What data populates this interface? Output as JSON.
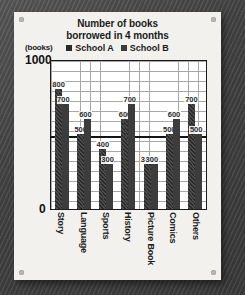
{
  "card": {
    "corner_dot": "screw-dot"
  },
  "chart_data": {
    "type": "bar",
    "title": "Number of books\nborrowed in 4 months",
    "title_line1": "Number of books",
    "title_line2": "borrowed in 4 months",
    "ylabel": "(books)",
    "xlabel": "",
    "ylim": [
      0,
      1000
    ],
    "y_tick_labels": [
      "1000",
      "0"
    ],
    "grid": true,
    "legend_position": "top-center",
    "categories": [
      "Story",
      "Language",
      "Sports",
      "History",
      "Picture Book",
      "Comics",
      "Others"
    ],
    "series": [
      {
        "name": "School A",
        "color": "#2a2a2a",
        "values": [
          800,
          500,
          400,
          600,
          300,
          500,
          700
        ]
      },
      {
        "name": "School B",
        "color": "#3c3c3c",
        "values": [
          700,
          600,
          300,
          700,
          300,
          600,
          500
        ]
      }
    ],
    "annotation_line": {
      "value": 500,
      "label": ""
    }
  }
}
